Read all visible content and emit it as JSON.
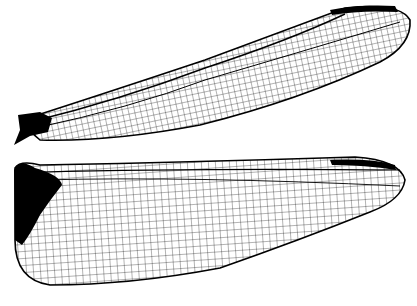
{
  "image": {
    "subject": "Dragonfly wings (forewing and hindwing) venation silhouette",
    "background": "#ffffff",
    "ink": "#000000"
  },
  "wings": [
    {
      "name": "forewing",
      "position": "top"
    },
    {
      "name": "hindwing",
      "position": "bottom"
    }
  ]
}
